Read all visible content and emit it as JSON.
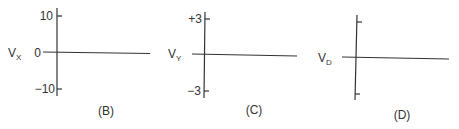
{
  "panels": [
    {
      "id": "B",
      "caption": "(B)",
      "ylabel_main": "V",
      "ylabel_sub": "X",
      "ticks": {
        "top": "10",
        "zero": "0",
        "bottom": "−10"
      },
      "trace": "flat line at 0"
    },
    {
      "id": "C",
      "caption": "(C)",
      "ylabel_main": "V",
      "ylabel_sub": "Y",
      "ticks": {
        "top": "+3",
        "zero": "",
        "bottom": "−3"
      },
      "trace": "flat line at 0"
    },
    {
      "id": "D",
      "caption": "(D)",
      "ylabel_main": "V",
      "ylabel_sub": "D",
      "ticks": {
        "top": "",
        "zero": "",
        "bottom": ""
      },
      "trace": "flat line at 0"
    }
  ]
}
